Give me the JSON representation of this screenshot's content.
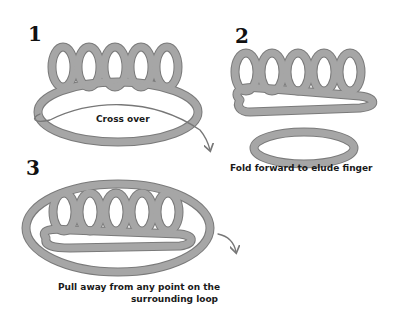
{
  "steps": [
    {
      "number": "1",
      "caption": "Cross over"
    },
    {
      "number": "2",
      "caption": "Fold forward to elude finger"
    },
    {
      "number": "3",
      "caption_line1": "Pull away from any point on the",
      "caption_line2": "surrounding loop"
    }
  ],
  "colors": {
    "rope_fill": "#a6a6a6",
    "rope_edge": "#7a7a7a",
    "arrow": "#777777",
    "text": "#1a1a1a"
  }
}
